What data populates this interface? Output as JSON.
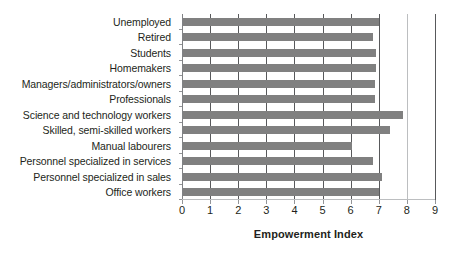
{
  "chart_data": {
    "type": "bar",
    "orientation": "horizontal",
    "title": "",
    "xlabel": "Empowerment Index",
    "ylabel": "",
    "xlim": [
      0,
      9
    ],
    "xticks": [
      "0",
      "1",
      "2",
      "3",
      "4",
      "5",
      "6",
      "7",
      "8",
      "9"
    ],
    "grid": true,
    "legend": false,
    "bar_color": "#808080",
    "categories": [
      "Unemployed",
      "Retired",
      "Students",
      "Homemakers",
      "Managers/administrators/owners",
      "Professionals",
      "Science and technology workers",
      "Skilled, semi-skilled workers",
      "Manual labourers",
      "Personnel specialized in services",
      "Personnel specialized in sales",
      "Office workers"
    ],
    "values": [
      7.0,
      6.8,
      6.9,
      6.9,
      6.85,
      6.85,
      7.85,
      7.4,
      6.05,
      6.8,
      7.1,
      7.0
    ]
  }
}
